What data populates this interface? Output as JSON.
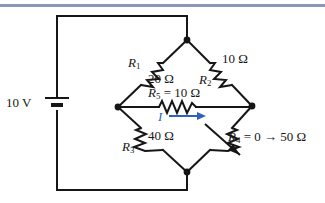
{
  "figure": {
    "name": "wheatstone-bridge-circuit",
    "top_rule_color": "#8b97b8",
    "line_color": "#161616",
    "accent_color": "#2f5fbf"
  },
  "source": {
    "symbol": "battery",
    "label": "10 V"
  },
  "components": [
    {
      "id": "R1",
      "name": "R₁",
      "label": "R",
      "subscript": "1",
      "value": "20 Ω",
      "type": "resistor"
    },
    {
      "id": "R2",
      "name": "R₂",
      "label": "R",
      "subscript": "2",
      "value": "10 Ω",
      "type": "resistor"
    },
    {
      "id": "R3",
      "name": "R₃",
      "label": "R",
      "subscript": "3",
      "value": "40 Ω",
      "type": "resistor"
    },
    {
      "id": "R4",
      "name": "R₄",
      "label": "R",
      "subscript": "4",
      "value": "0 → 50 Ω",
      "type": "variable-resistor"
    },
    {
      "id": "R5",
      "name": "R₅",
      "label": "R",
      "subscript": "5",
      "value": "10 Ω",
      "type": "resistor"
    }
  ],
  "labels": {
    "source_label": "10 V",
    "r1_name": "R",
    "r1_sub": "1",
    "r1_value": "20 Ω",
    "r2_name": "R",
    "r2_sub": "2",
    "r2_value": "10 Ω",
    "r3_name": "R",
    "r3_sub": "3",
    "r3_value": "40 Ω",
    "r4_name": "R",
    "r4_sub": "4",
    "r4_value": " = 0 → 50 Ω",
    "r5_name": "R",
    "r5_sub": "5",
    "r5_value": " = 10 Ω",
    "current_label": "I"
  }
}
